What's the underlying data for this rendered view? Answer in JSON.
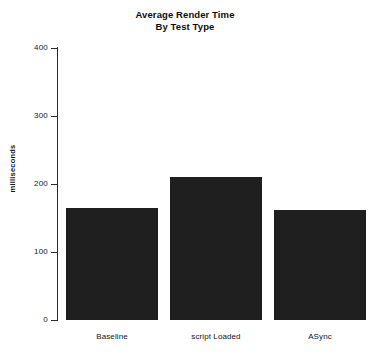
{
  "chart_data": {
    "type": "bar",
    "title": "Average Render Time",
    "title_line2": "By Test Type",
    "xlabel": "",
    "ylabel": "milliseconds",
    "categories": [
      "Baseline",
      "script Loaded",
      "ASync"
    ],
    "values": [
      165,
      210,
      162
    ],
    "ylim": [
      0,
      400
    ],
    "yticks": [
      0,
      100,
      200,
      300,
      400
    ],
    "ytick_labels": [
      "0",
      "100",
      "200",
      "300",
      "400"
    ],
    "grid": false,
    "legend": false,
    "bar_color": "#1f1f1f",
    "background_color": "#ffffff",
    "axis_color": "#2b2b2b"
  }
}
